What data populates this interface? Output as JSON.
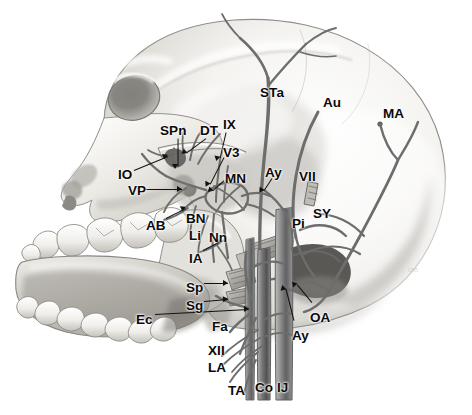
{
  "figure": {
    "kind": "anatomical-illustration",
    "view": "lateral skull, left side, pencil/graphite rendering",
    "palette": {
      "background": "#ffffff",
      "bone_light": "#fbfbfa",
      "bone_mid": "#d9d8d4",
      "bone_shadow": "#9a9892",
      "bone_deep_shadow": "#5d5b57",
      "vessel_line": "#6a6a6a",
      "vessel_dark": "#3a3a3a",
      "vein_fill": "#8d8d8d",
      "label_text": "#0a0a0a",
      "leader_line": "#111111"
    }
  },
  "labels": [
    {
      "id": "SPn",
      "text": "SPn",
      "x": 160,
      "y": 124,
      "leader": {
        "x1": 178,
        "y1": 138,
        "x2": 178,
        "y2": 166
      }
    },
    {
      "id": "DT",
      "text": "DT",
      "x": 200,
      "y": 124,
      "leader": {
        "x1": 206,
        "y1": 138,
        "x2": 187,
        "y2": 152
      }
    },
    {
      "id": "IX",
      "text": "IX",
      "x": 223,
      "y": 118,
      "leader": {
        "x1": 226,
        "y1": 132,
        "x2": 220,
        "y2": 158
      }
    },
    {
      "id": "V3",
      "text": "V3",
      "x": 223,
      "y": 146,
      "leader": {
        "x1": 224,
        "y1": 157,
        "x2": 210,
        "y2": 184
      }
    },
    {
      "id": "MN",
      "text": "MN",
      "x": 225,
      "y": 172,
      "leader": {
        "x1": 224,
        "y1": 180,
        "x2": 213,
        "y2": 190
      }
    },
    {
      "id": "IO",
      "text": "IO",
      "x": 118,
      "y": 168,
      "leader": {
        "x1": 134,
        "y1": 170,
        "x2": 168,
        "y2": 156
      }
    },
    {
      "id": "VP",
      "text": "VP",
      "x": 128,
      "y": 184,
      "leader": {
        "x1": 146,
        "y1": 189,
        "x2": 182,
        "y2": 189
      }
    },
    {
      "id": "AB",
      "text": "AB",
      "x": 146,
      "y": 219,
      "leader": {
        "x1": 166,
        "y1": 218,
        "x2": 186,
        "y2": 208
      }
    },
    {
      "id": "BN",
      "text": "BN",
      "x": 186,
      "y": 212,
      "leader": null
    },
    {
      "id": "Li",
      "text": "Li",
      "x": 189,
      "y": 229,
      "leader": null
    },
    {
      "id": "Nn",
      "text": "Nn",
      "x": 209,
      "y": 231,
      "leader": null
    },
    {
      "id": "IA",
      "text": "IA",
      "x": 189,
      "y": 252,
      "leader": {
        "x1": 203,
        "y1": 250,
        "x2": 221,
        "y2": 241
      }
    },
    {
      "id": "Sp",
      "text": "Sp",
      "x": 186,
      "y": 281,
      "leader": {
        "x1": 204,
        "y1": 283,
        "x2": 228,
        "y2": 283
      }
    },
    {
      "id": "Sg",
      "text": "Sg",
      "x": 186,
      "y": 299,
      "leader": {
        "x1": 204,
        "y1": 301,
        "x2": 228,
        "y2": 299
      }
    },
    {
      "id": "Ec",
      "text": "Ec",
      "x": 136,
      "y": 313,
      "leader": {
        "x1": 155,
        "y1": 314,
        "x2": 249,
        "y2": 309
      }
    },
    {
      "id": "Fa",
      "text": "Fa",
      "x": 212,
      "y": 320,
      "leader": null
    },
    {
      "id": "XII",
      "text": "XII",
      "x": 208,
      "y": 344,
      "leader": null
    },
    {
      "id": "LA",
      "text": "LA",
      "x": 208,
      "y": 361,
      "leader": null
    },
    {
      "id": "TA",
      "text": "TA",
      "x": 228,
      "y": 384,
      "leader": null
    },
    {
      "id": "Co",
      "text": "Co",
      "x": 255,
      "y": 381,
      "leader": null
    },
    {
      "id": "IJ",
      "text": "IJ",
      "x": 277,
      "y": 381,
      "leader": null
    },
    {
      "id": "STa",
      "text": "STa",
      "x": 260,
      "y": 86,
      "leader": null
    },
    {
      "id": "Au",
      "text": "Au",
      "x": 323,
      "y": 96,
      "leader": null
    },
    {
      "id": "MA",
      "text": "MA",
      "x": 383,
      "y": 107,
      "leader": null
    },
    {
      "id": "Ay1",
      "text": "Ay",
      "x": 265,
      "y": 166,
      "leader": {
        "x1": 272,
        "y1": 178,
        "x2": 264,
        "y2": 190
      }
    },
    {
      "id": "VII",
      "text": "VII",
      "x": 299,
      "y": 170,
      "leader": null
    },
    {
      "id": "Pi",
      "text": "Pi",
      "x": 292,
      "y": 217,
      "leader": null
    },
    {
      "id": "SY",
      "text": "SY",
      "x": 313,
      "y": 207,
      "leader": null
    },
    {
      "id": "OA",
      "text": "OA",
      "x": 310,
      "y": 311,
      "leader": {
        "x1": 312,
        "y1": 302,
        "x2": 297,
        "y2": 284
      }
    },
    {
      "id": "Ay2",
      "text": "Ay",
      "x": 292,
      "y": 329,
      "leader": {
        "x1": 294,
        "y1": 320,
        "x2": 286,
        "y2": 288
      }
    }
  ],
  "legend_meaning": {
    "SPn": "Sphenopalatine nerve",
    "DT": "Deep temporal nerve",
    "IX": "Glossopharyngeal nerve",
    "V3": "Mandibular division of trigeminal nerve",
    "MN": "Maxillary nerve",
    "IO": "Infraorbital nerve",
    "VP": "Vidian / pterygoid nerve",
    "AB": "Alveolar branch",
    "BN": "Buccal nerve",
    "Li": "Lingual nerve",
    "Nn": "Nerve branches",
    "IA": "Inferior alveolar nerve",
    "Sp": "Stylopharyngeus muscle",
    "Sg": "Styloglossus muscle",
    "Ec": "External carotid artery",
    "Fa": "Facial artery",
    "XII": "Hypoglossal nerve",
    "LA": "Lingual artery",
    "TA": "Thyroid artery",
    "Co": "Common carotid artery",
    "IJ": "Internal jugular vein",
    "STa": "Superficial temporal artery",
    "Au": "Auricular branch",
    "MA": "Mastoid artery branch",
    "Ay": "Artery",
    "VII": "Facial nerve",
    "Pi": "Posterior auricular / parotid branch",
    "SY": "Sympathetic trunk",
    "OA": "Occipital artery"
  }
}
